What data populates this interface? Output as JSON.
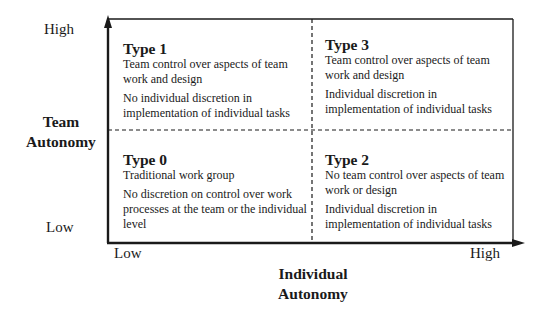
{
  "y_axis": {
    "title_line1": "Team",
    "title_line2": "Autonomy",
    "high_label": "High",
    "low_label": "Low"
  },
  "x_axis": {
    "title_line1": "Individual",
    "title_line2": "Autonomy",
    "low_label": "Low",
    "high_label": "High"
  },
  "quadrants": [
    {
      "position": "top-left",
      "title": "Type 1",
      "desc1": "Team control over aspects of team work and design",
      "desc2": "No individual discretion in implementation of individual tasks"
    },
    {
      "position": "top-right",
      "title": "Type 3",
      "desc1": "Team control over aspects of team work and design",
      "desc2": "Individual discretion in implementation of individual tasks"
    },
    {
      "position": "bottom-left",
      "title": "Type 0",
      "desc1": "Traditional work group",
      "desc2": "No discretion on control over work processes at the team or the individual level"
    },
    {
      "position": "bottom-right",
      "title": "Type 2",
      "desc1": "No team control over aspects of team work or design",
      "desc2": "Individual discretion in implementation of individual tasks"
    }
  ],
  "colors": {
    "line": "#1a1a1a",
    "background": "#ffffff"
  }
}
